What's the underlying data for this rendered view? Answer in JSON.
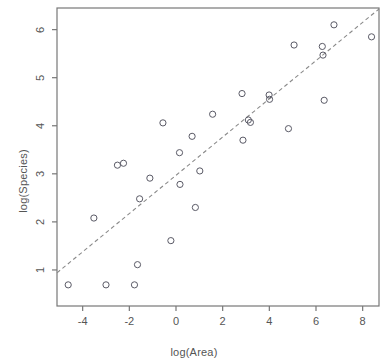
{
  "chart_data": {
    "type": "scatter",
    "title": "",
    "xlabel": "log(Area)",
    "ylabel": "log(Species)",
    "xlim": [
      -5.1,
      8.7
    ],
    "ylim": [
      0.25,
      6.45
    ],
    "xticks": [
      -4,
      -2,
      0,
      2,
      4,
      6,
      8
    ],
    "yticks": [
      1,
      2,
      3,
      4,
      5,
      6
    ],
    "xtick_labels": [
      "-4",
      "-2",
      "0",
      "2",
      "4",
      "6",
      "8"
    ],
    "ytick_labels": [
      "1",
      "2",
      "3",
      "4",
      "5",
      "6"
    ],
    "grid": false,
    "legend": "none",
    "marker": "open-circle",
    "points": [
      {
        "x": -4.62,
        "y": 0.69
      },
      {
        "x": -3.0,
        "y": 0.69
      },
      {
        "x": -1.78,
        "y": 0.69
      },
      {
        "x": -1.65,
        "y": 1.11
      },
      {
        "x": -3.52,
        "y": 2.08
      },
      {
        "x": -2.51,
        "y": 3.18
      },
      {
        "x": -2.25,
        "y": 3.22
      },
      {
        "x": -1.56,
        "y": 2.48
      },
      {
        "x": -1.12,
        "y": 2.91
      },
      {
        "x": -0.56,
        "y": 4.06
      },
      {
        "x": -0.22,
        "y": 1.61
      },
      {
        "x": 0.15,
        "y": 3.44
      },
      {
        "x": 0.17,
        "y": 2.78
      },
      {
        "x": 0.69,
        "y": 3.78
      },
      {
        "x": 0.83,
        "y": 2.3
      },
      {
        "x": 1.02,
        "y": 3.06
      },
      {
        "x": 1.57,
        "y": 4.24
      },
      {
        "x": 2.83,
        "y": 4.67
      },
      {
        "x": 2.87,
        "y": 3.7
      },
      {
        "x": 3.1,
        "y": 4.12
      },
      {
        "x": 3.19,
        "y": 4.07
      },
      {
        "x": 3.99,
        "y": 4.64
      },
      {
        "x": 4.01,
        "y": 4.55
      },
      {
        "x": 4.82,
        "y": 3.94
      },
      {
        "x": 5.06,
        "y": 5.68
      },
      {
        "x": 6.27,
        "y": 5.65
      },
      {
        "x": 6.3,
        "y": 5.47
      },
      {
        "x": 6.35,
        "y": 4.53
      },
      {
        "x": 6.77,
        "y": 6.1
      },
      {
        "x": 8.38,
        "y": 5.85
      }
    ],
    "fit_line": {
      "style": "dashed",
      "x_start": -5.1,
      "y_start": 0.94,
      "x_end": 8.7,
      "y_end": 6.43
    }
  },
  "layout": {
    "plot_box": {
      "left": 57,
      "top": 8,
      "right": 379,
      "bottom": 306
    },
    "marker_radius": 3.1
  }
}
